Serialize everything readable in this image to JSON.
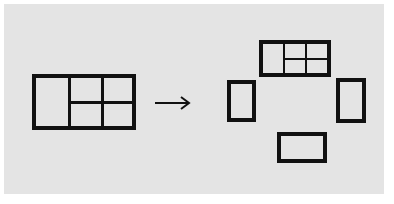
{
  "diagram": {
    "colors": {
      "background": "#e4e4e4",
      "stroke": "#111111"
    },
    "source": {
      "label": "assembled-window",
      "panes": 4
    },
    "arrow": {
      "direction": "right"
    },
    "result": {
      "pieces": [
        "window-frame-with-panes",
        "left-side-panel",
        "right-side-panel",
        "bottom-panel"
      ]
    }
  }
}
